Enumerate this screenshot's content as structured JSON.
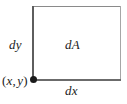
{
  "figure": {
    "name": "differential-area-element",
    "background_color": "#ffffff",
    "labels": {
      "dy": "dy",
      "dA": "dA",
      "dx": "dx",
      "point_open_paren": "(",
      "point_x": "x",
      "point_comma": ",",
      "point_y": "y",
      "point_close_paren": ")",
      "point_full": "(x, y)"
    },
    "colors": {
      "edge_top": "#8a8a8a",
      "edge_right": "#a6a6a6",
      "edge_bottom": "#6b6b6b",
      "edge_left": "#5e5e5e",
      "vertex_dot": "#1a1a1a",
      "text": "#1c1c1c"
    }
  }
}
